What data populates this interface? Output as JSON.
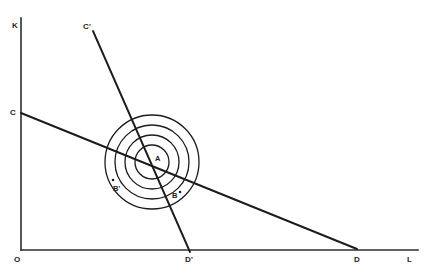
{
  "figure": {
    "type": "economics-isoquant-isocost-diagram",
    "background_color": "#ffffff",
    "line_color": "#1c1c1c",
    "axis_color": "#2e2e2e",
    "width": 430,
    "height": 274
  },
  "axes": {
    "vertical": {
      "label": "K",
      "label_x": 12,
      "label_y": 22,
      "x": 21,
      "y_top": 18,
      "y_bottom": 250
    },
    "horizontal": {
      "label": "L",
      "label_x": 407,
      "label_y": 256,
      "y": 250,
      "x_left": 21,
      "x_right": 418
    },
    "origin": {
      "label": "O",
      "label_x": 14,
      "label_y": 256
    }
  },
  "isocost_lines": [
    {
      "name": "CD",
      "start_label": "C",
      "end_label": "D",
      "x1": 21,
      "y1": 113,
      "x2": 357,
      "y2": 249,
      "start_label_x": 10,
      "start_label_y": 109,
      "end_label_x": 354,
      "end_label_y": 256
    },
    {
      "name": "C'D'",
      "start_label": "C'",
      "end_label": "D'",
      "x1": 93,
      "y1": 31,
      "x2": 190,
      "y2": 252,
      "start_label_x": 83,
      "start_label_y": 23,
      "end_label_x": 185,
      "end_label_y": 256
    }
  ],
  "isoquants": {
    "center_x": 152,
    "center_y": 162,
    "radii": [
      47,
      37,
      27,
      17
    ],
    "count": 4
  },
  "points": [
    {
      "label": "A",
      "label_x": 155,
      "label_y": 155,
      "dot_x": null,
      "dot_y": null,
      "has_dot": false
    },
    {
      "label": "B'",
      "label_x": 113,
      "label_y": 185,
      "dot_x": 113,
      "dot_y": 180,
      "has_dot": true
    },
    {
      "label": "B",
      "label_x": 172,
      "label_y": 192,
      "dot_x": 180,
      "dot_y": 192,
      "has_dot": true
    }
  ]
}
